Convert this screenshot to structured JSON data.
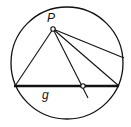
{
  "diagram": {
    "labels": {
      "point": "P",
      "line": "g"
    },
    "colors": {
      "stroke": "#111111",
      "background": "#ffffff"
    },
    "circle": {
      "cx": 67,
      "cy": 63,
      "r": 56
    },
    "point_p": {
      "x": 53,
      "y": 29
    },
    "line_g": {
      "x1": 14,
      "y1": 86,
      "x2": 119,
      "y2": 86
    },
    "intersection_point": {
      "x": 83,
      "y": 86
    },
    "rays_from_p": [
      {
        "x2": 15,
        "y2": 86
      },
      {
        "x2": 119,
        "y2": 86
      },
      {
        "x2": 88,
        "y2": 98
      },
      {
        "x2": 124,
        "y2": 58
      }
    ]
  }
}
